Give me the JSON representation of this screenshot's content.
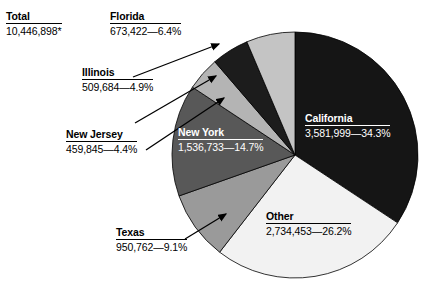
{
  "chart_data": {
    "type": "pie",
    "title": "",
    "total_label": "Total",
    "total_value": "10,446,898*",
    "categories": [
      "California",
      "Other",
      "Texas",
      "New York",
      "New Jersey",
      "Illinois",
      "Florida"
    ],
    "values": [
      34.3,
      26.2,
      9.1,
      14.7,
      4.4,
      4.9,
      6.4
    ],
    "counts": [
      3581999,
      2734453,
      950762,
      1536733,
      459845,
      509684,
      673422
    ],
    "slices": [
      {
        "name": "California",
        "count_text": "3,581,999",
        "percent_text": "34.3%",
        "value_text": "3,581,999—34.3%",
        "percent": 34.3,
        "color": "#151515",
        "label_placement": "inside",
        "label_color": "#ffffff"
      },
      {
        "name": "Other",
        "count_text": "2,734,453",
        "percent_text": "26.2%",
        "value_text": "2,734,453—26.2%",
        "percent": 26.2,
        "color": "#f2f2f2",
        "label_placement": "inside",
        "label_color": "#000000"
      },
      {
        "name": "Texas",
        "count_text": "950,762",
        "percent_text": "9.1%",
        "value_text": "950,762—9.1%",
        "percent": 9.1,
        "color": "#9a9a9a",
        "label_placement": "outside",
        "label_color": "#000000"
      },
      {
        "name": "New York",
        "count_text": "1,536,733",
        "percent_text": "14.7%",
        "value_text": "1,536,733—14.7%",
        "percent": 14.7,
        "color": "#585858",
        "label_placement": "inside",
        "label_color": "#ffffff"
      },
      {
        "name": "New Jersey",
        "count_text": "459,845",
        "percent_text": "4.4%",
        "value_text": "459,845—4.4%",
        "percent": 4.4,
        "color": "#b4b4b4",
        "label_placement": "outside",
        "label_color": "#000000"
      },
      {
        "name": "Illinois",
        "count_text": "509,684",
        "percent_text": "4.9%",
        "value_text": "509,684—4.9%",
        "percent": 4.9,
        "color": "#1c1c1c",
        "label_placement": "outside",
        "label_color": "#000000"
      },
      {
        "name": "Florida",
        "count_text": "673,422",
        "percent_text": "6.4%",
        "value_text": "673,422—6.4%",
        "percent": 6.4,
        "color": "#c4c4c4",
        "label_placement": "outside",
        "label_color": "#000000"
      }
    ],
    "start_angle_deg": 0,
    "direction": "clockwise",
    "legend": "none",
    "grid": false
  },
  "total": {
    "label": "Total",
    "value": "10,446,898*"
  },
  "callouts": {
    "florida": {
      "name": "Florida",
      "value": "673,422—6.4%"
    },
    "illinois": {
      "name": "Illinois",
      "value": "509,684—4.9%"
    },
    "new_jersey": {
      "name": "New Jersey",
      "value": "459,845—4.4%"
    },
    "texas": {
      "name": "Texas",
      "value": "950,762—9.1%"
    }
  },
  "inside_labels": {
    "new_york": {
      "name": "New York",
      "value": "1,536,733—14.7%"
    },
    "california": {
      "name": "California",
      "value": "3,581,999—34.3%"
    },
    "other": {
      "name": "Other",
      "value": "2,734,453—26.2%"
    }
  }
}
